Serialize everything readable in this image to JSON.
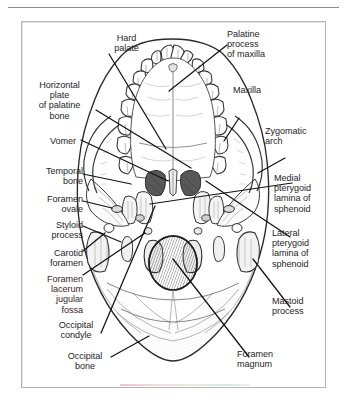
{
  "page": {
    "top_rule": true,
    "frame_border_color": "#b4b4b4",
    "background": "#ffffff",
    "text_color": "#262626"
  },
  "figure": {
    "title": "",
    "view": "Inferior view of the skull (skull base / palate)",
    "labels": [
      {
        "id": "hard-palate",
        "text": "Hard\npalate",
        "align": "center",
        "x": 99,
        "y": 33,
        "w": 55
      },
      {
        "id": "palatine-process",
        "text": "Palatine\nprocess\nof maxilla",
        "align": "left",
        "x": 227,
        "y": 29,
        "w": 72
      },
      {
        "id": "horizontal-plate",
        "text": "Horizontal\nplate\nof palatine\nbone",
        "align": "center",
        "x": 25,
        "y": 80,
        "w": 69
      },
      {
        "id": "maxilla",
        "text": "Maxilla",
        "align": "left",
        "x": 233,
        "y": 85,
        "w": 48
      },
      {
        "id": "zygomatic-arch",
        "text": "Zygomatic\narch",
        "align": "left",
        "x": 265,
        "y": 126,
        "w": 60
      },
      {
        "id": "vomer",
        "text": "Vomer",
        "align": "right",
        "x": 28,
        "y": 136,
        "w": 48
      },
      {
        "id": "temporal-bone",
        "text": "Temporal\nbone",
        "align": "right",
        "x": 28,
        "y": 166,
        "w": 55
      },
      {
        "id": "medial-pterygoid",
        "text": "Medial\npterygoid\nlamina of\nsphenoid",
        "align": "left",
        "x": 274,
        "y": 173,
        "w": 60
      },
      {
        "id": "foramen-ovale",
        "text": "Foramen\novale",
        "align": "right",
        "x": 24,
        "y": 194,
        "w": 59
      },
      {
        "id": "styloid-process",
        "text": "Styloid\nprocess",
        "align": "right",
        "x": 27,
        "y": 220,
        "w": 56
      },
      {
        "id": "lateral-pterygoid",
        "text": "Lateral\npterygoid\nlamina of\nsphenoid",
        "align": "left",
        "x": 272,
        "y": 228,
        "w": 62
      },
      {
        "id": "carotid-foramen",
        "text": "Carotid\nforamen",
        "align": "right",
        "x": 25,
        "y": 248,
        "w": 58
      },
      {
        "id": "foramen-lacerum",
        "text": "Foramen\nlacerum\njugular\nfossa",
        "align": "right",
        "x": 27,
        "y": 274,
        "w": 56,
        "warm": true
      },
      {
        "id": "mastoid-process",
        "text": "Mastoid\nprocess",
        "align": "left",
        "x": 272,
        "y": 296,
        "w": 58
      },
      {
        "id": "occipital-condyle",
        "text": "Occipital\ncondyle",
        "align": "center",
        "x": 46,
        "y": 320,
        "w": 60
      },
      {
        "id": "occipital-bone",
        "text": "Occipital\nbone",
        "align": "center",
        "x": 56,
        "y": 351,
        "w": 58
      },
      {
        "id": "foramen-magnum",
        "text": "Foramen\nmagnum",
        "align": "left",
        "x": 237,
        "y": 349,
        "w": 62
      }
    ],
    "structures": [
      "hard palate",
      "palatine process of maxilla",
      "horizontal plate of palatine bone",
      "maxilla",
      "zygomatic arch",
      "vomer",
      "temporal bone",
      "medial pterygoid lamina of sphenoid",
      "foramen ovale",
      "styloid process",
      "lateral pterygoid lamina of sphenoid",
      "carotid foramen",
      "foramen lacerum jugular fossa",
      "mastoid process",
      "occipital condyle",
      "occipital bone",
      "foramen magnum"
    ]
  }
}
